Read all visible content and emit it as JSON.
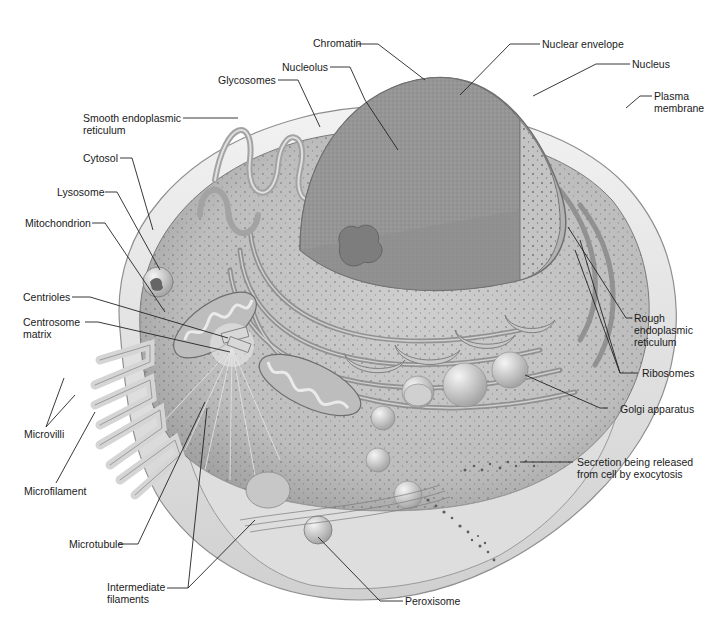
{
  "diagram": {
    "labels": {
      "chromatin": "Chromatin",
      "nuclear_envelope": "Nuclear envelope",
      "nucleolus": "Nucleolus",
      "nucleus": "Nucleus",
      "glycosomes": "Glycosomes",
      "plasma_membrane_1": "Plasma",
      "plasma_membrane_2": "membrane",
      "smooth_er_1": "Smooth endoplasmic",
      "smooth_er_2": "reticulum",
      "cytosol": "Cytosol",
      "lysosome": "Lysosome",
      "mitochondrion": "Mitochondrion",
      "centrioles": "Centrioles",
      "centrosome_matrix_1": "Centrosome",
      "centrosome_matrix_2": "matrix",
      "rough_er_1": "Rough",
      "rough_er_2": "endoplasmic",
      "rough_er_3": "reticulum",
      "ribosomes": "Ribosomes",
      "golgi": "Golgi apparatus",
      "microvilli": "Microvilli",
      "secretion_1": "Secretion being released",
      "secretion_2": "from cell by exocytosis",
      "microfilament": "Microfilament",
      "microtubule": "Microtubule",
      "intermediate_filaments_1": "Intermediate",
      "intermediate_filaments_2": "filaments",
      "peroxisome": "Peroxisome"
    },
    "colors": {
      "background": "#ffffff",
      "text": "#1a1a1a",
      "leader_line": "#222222",
      "cell_light": "#e6e6e6",
      "cell_mid": "#b5b5b5",
      "cell_dark": "#7a7a7a",
      "nucleus": "#9c9c9c"
    }
  }
}
